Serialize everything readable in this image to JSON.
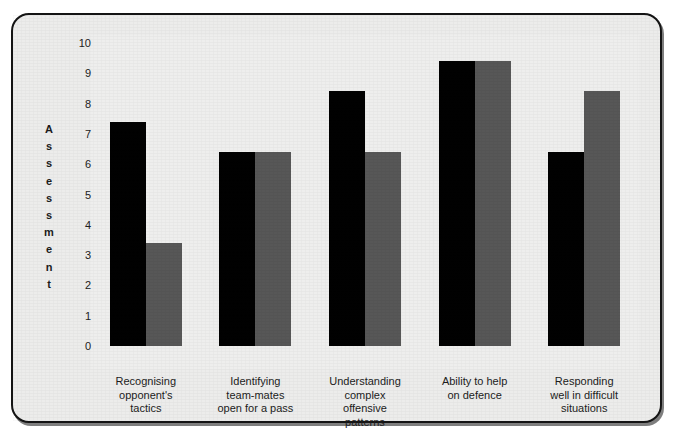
{
  "chart_data": {
    "type": "bar",
    "title": "",
    "subtitle": "",
    "xlabel": "",
    "ylabel": "Assessment",
    "ylim": [
      0,
      10
    ],
    "yticks": [
      "10",
      "9",
      "8",
      "7",
      "6",
      "5",
      "4",
      "3",
      "2",
      "1",
      "0"
    ],
    "grid": false,
    "legend": "none",
    "categories": [
      "Recognising\nopponent's\ntactics",
      "Identifying\nteam-mates\nopen for a pass",
      "Understanding\ncomplex\noffensive\npatterns",
      "Ability to help\non defence",
      "Responding\nwell in difficult\nsituations"
    ],
    "category_lines": [
      [
        "Recognising",
        "opponent's",
        "tactics"
      ],
      [
        "Identifying",
        "team-mates",
        "open for a pass"
      ],
      [
        "Understanding",
        "complex",
        "offensive",
        "patterns"
      ],
      [
        "Ability to help",
        "on defence"
      ],
      [
        "Responding",
        "well in difficult",
        "situations"
      ]
    ],
    "series": [
      {
        "name": "Series 1",
        "color": "#010101",
        "values": [
          7.4,
          6.4,
          8.4,
          9.4,
          6.4
        ]
      },
      {
        "name": "Series 2",
        "color": "#575757",
        "values": [
          3.4,
          6.4,
          6.4,
          9.4,
          8.4
        ]
      }
    ]
  },
  "figure": {
    "border_color": "#141414",
    "background_color": "#ececeb",
    "plot_background_color": "#eeeeed"
  }
}
